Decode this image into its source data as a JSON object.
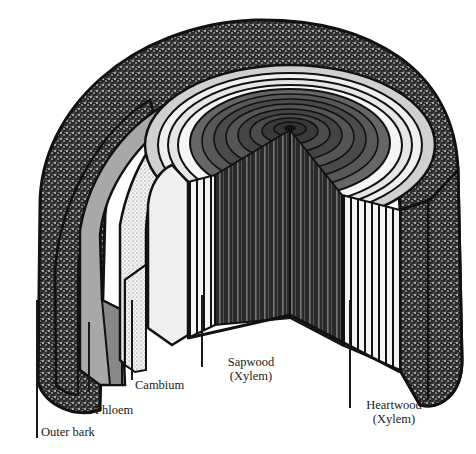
{
  "diagram": {
    "colors": {
      "ink": "#111111",
      "bark": "#2b2b2b",
      "phloem": "#9a9a9a",
      "cambium": "#d8d8d8",
      "sapwood": "#eeeeee",
      "heartwood": "#3a3a3a",
      "background": "#ffffff"
    },
    "labels": [
      {
        "id": "outer-bark",
        "text": "Outer bark"
      },
      {
        "id": "phloem",
        "text": "Phloem"
      },
      {
        "id": "cambium",
        "text": "Cambium"
      },
      {
        "id": "sapwood",
        "line1": "Sapwood",
        "line2": "(Xylem)"
      },
      {
        "id": "heartwood",
        "line1": "Heartwood",
        "line2": "(Xylem)"
      }
    ]
  }
}
